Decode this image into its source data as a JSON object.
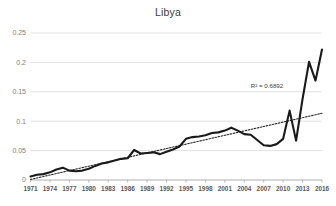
{
  "chart_data": {
    "type": "line",
    "title": "Libya",
    "xlabel": "",
    "ylabel": "",
    "ylim": [
      0,
      0.25
    ],
    "xlim": [
      1971,
      2016
    ],
    "grid": true,
    "legend": false,
    "ytick_labels": [
      "0",
      "0.05",
      "0.1",
      "0.15",
      "0.2",
      "0.25"
    ],
    "ytick_values": [
      0,
      0.05,
      0.1,
      0.15,
      0.2,
      0.25
    ],
    "xtick_labels": [
      "1971",
      "1974",
      "1977",
      "1980",
      "1983",
      "1986",
      "1989",
      "1992",
      "1995",
      "1998",
      "2001",
      "2004",
      "2007",
      "2010",
      "2013",
      "2016"
    ],
    "xtick_values": [
      1971,
      1974,
      1977,
      1980,
      1983,
      1986,
      1989,
      1992,
      1995,
      1998,
      2001,
      2004,
      2007,
      2010,
      2013,
      2016
    ],
    "annotations": [
      {
        "text": "R² = 0.6892",
        "x": 2005,
        "y": 0.157
      }
    ],
    "x": [
      1971,
      1972,
      1973,
      1974,
      1975,
      1976,
      1977,
      1978,
      1979,
      1980,
      1981,
      1982,
      1983,
      1984,
      1985,
      1986,
      1987,
      1988,
      1989,
      1990,
      1991,
      1992,
      1993,
      1994,
      1995,
      1996,
      1997,
      1998,
      1999,
      2000,
      2001,
      2002,
      2003,
      2004,
      2005,
      2006,
      2007,
      2008,
      2009,
      2010,
      2011,
      2012,
      2013,
      2014,
      2015,
      2016
    ],
    "series": [
      {
        "name": "Libya",
        "style": "solid",
        "values": [
          0.006,
          0.009,
          0.01,
          0.013,
          0.018,
          0.021,
          0.016,
          0.015,
          0.016,
          0.019,
          0.024,
          0.028,
          0.03,
          0.033,
          0.036,
          0.037,
          0.051,
          0.045,
          0.046,
          0.047,
          0.044,
          0.048,
          0.052,
          0.057,
          0.07,
          0.073,
          0.074,
          0.076,
          0.08,
          0.081,
          0.084,
          0.089,
          0.084,
          0.078,
          0.077,
          0.068,
          0.059,
          0.058,
          0.061,
          0.07,
          0.118,
          0.067,
          0.138,
          0.201,
          0.169,
          0.222
        ]
      },
      {
        "name": "Linear trendline",
        "style": "dotted",
        "values": [
          0.001,
          0.0035,
          0.006,
          0.0085,
          0.011,
          0.0135,
          0.016,
          0.0185,
          0.021,
          0.0235,
          0.026,
          0.0285,
          0.031,
          0.0335,
          0.036,
          0.0385,
          0.041,
          0.0435,
          0.046,
          0.0485,
          0.051,
          0.0535,
          0.056,
          0.0585,
          0.061,
          0.0635,
          0.066,
          0.0685,
          0.071,
          0.0735,
          0.076,
          0.0785,
          0.081,
          0.0835,
          0.086,
          0.0885,
          0.091,
          0.0935,
          0.096,
          0.0985,
          0.101,
          0.1035,
          0.106,
          0.1085,
          0.111,
          0.1135
        ]
      }
    ]
  }
}
